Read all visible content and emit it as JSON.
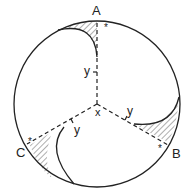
{
  "diagram": {
    "labels": {
      "A": "A",
      "B": "B",
      "C": "C",
      "center": "x",
      "y1": "y",
      "y2": "y",
      "y3": "y",
      "star_a": "*",
      "star_b": "*",
      "star_c": "*"
    },
    "colors": {
      "stroke": "#222222",
      "background": "#ffffff"
    }
  }
}
